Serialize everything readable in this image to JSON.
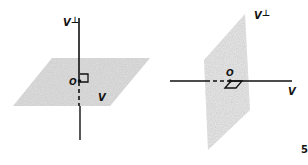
{
  "figure_left": {
    "description": "Plane V with perpendicular line V-perp through origin O",
    "labels": {
      "perp": "V⊥",
      "origin": "O",
      "subspace": "V"
    }
  },
  "figure_right": {
    "description": "Line V with perpendicular plane V-perp through origin O",
    "labels": {
      "perp": "V⊥",
      "origin": "O",
      "subspace": "V"
    }
  },
  "page_number": "5",
  "colors": {
    "plane_fill": "#d9d9d9",
    "line": "#111111"
  }
}
